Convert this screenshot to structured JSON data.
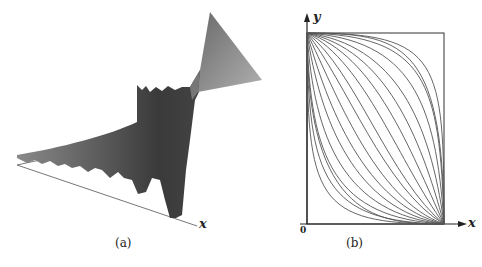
{
  "panels": [
    {
      "caption": "(a)",
      "axis_label": "x",
      "description": "3D surface plot with oscillating edges"
    },
    {
      "caption": "(b)",
      "x_axis_label": "x",
      "y_axis_label": "y",
      "origin_label": "0",
      "description": "Family of curves from top-left corner to bottom-right corner of a rectangle"
    }
  ]
}
